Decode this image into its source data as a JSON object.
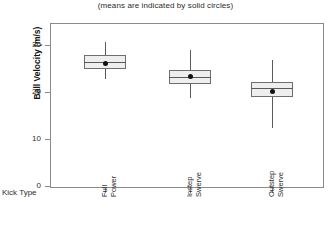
{
  "chart_data": {
    "type": "box",
    "title": "",
    "subtitle": "(means are indicated by solid circles)",
    "xlabel": "Kick Type",
    "ylabel": "Ball Velocity (m/s)",
    "categories": [
      "Full Power",
      "Instep Swerve",
      "Outstep Swerve"
    ],
    "category_lines": [
      [
        "Full",
        "Power"
      ],
      [
        "Instep",
        "Swerve"
      ],
      [
        "Outstep",
        "Swerve"
      ]
    ],
    "ylim": [
      0,
      34
    ],
    "yticks": [
      0,
      10,
      20,
      30
    ],
    "ytick_labels": [
      "0",
      "10",
      "20",
      "30"
    ],
    "grid": false,
    "legend": "none",
    "boxes": [
      {
        "category": "Full Power",
        "whisker_low": 22.8,
        "q1": 24.8,
        "median": 26.4,
        "q3": 27.8,
        "whisker_high": 30.7,
        "mean": 26.1
      },
      {
        "category": "Instep Swerve",
        "whisker_low": 18.8,
        "q1": 21.6,
        "median": 23.2,
        "q3": 24.6,
        "whisker_high": 28.9,
        "mean": 23.2
      },
      {
        "category": "Outstep Swerve",
        "whisker_low": 12.4,
        "q1": 18.9,
        "median": 20.8,
        "q3": 22.2,
        "whisker_high": 26.9,
        "mean": 20.2
      }
    ]
  }
}
